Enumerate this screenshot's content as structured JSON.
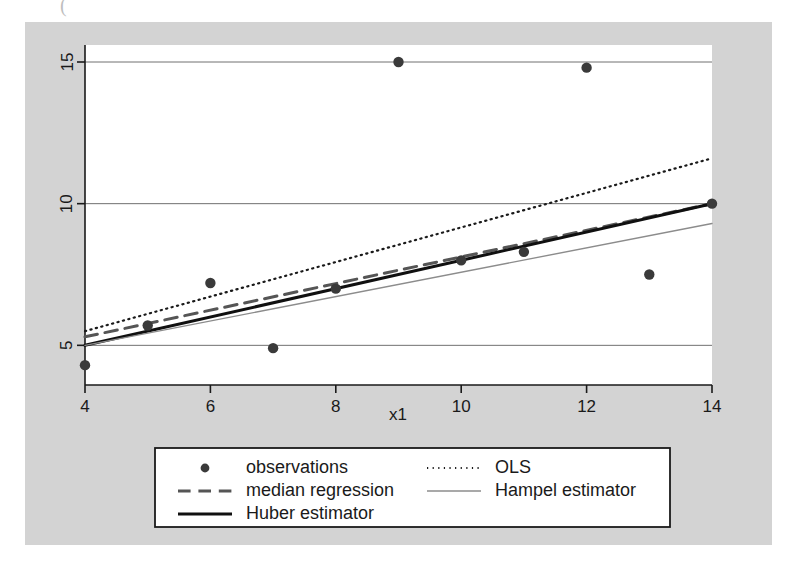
{
  "figure": {
    "canvas_color": "#d3d3d3",
    "plot_background": "#ffffff",
    "artifact_glyph": "("
  },
  "chart_data": {
    "type": "scatter",
    "title": "",
    "xlabel": "x1",
    "ylabel": "",
    "xlim": [
      4,
      14
    ],
    "ylim": [
      3.6,
      15.6
    ],
    "xticks": [
      4,
      6,
      8,
      10,
      12,
      14
    ],
    "xticklabels": [
      "4",
      "6",
      "8",
      "10",
      "12",
      "14"
    ],
    "yticks": [
      5,
      10,
      15
    ],
    "yticklabels": [
      "5",
      "10",
      "15"
    ],
    "grid": "horizontal",
    "legend_position": "below-plot",
    "points": {
      "name": "observations",
      "x": [
        4,
        5,
        6,
        7,
        8,
        9,
        10,
        11,
        12,
        13,
        14
      ],
      "y": [
        4.3,
        5.7,
        7.2,
        4.9,
        7.0,
        15.0,
        8.0,
        8.3,
        14.8,
        7.5,
        10.0
      ],
      "color": "#3a3a3a",
      "marker": "filled-circle"
    },
    "series": [
      {
        "name": "OLS",
        "style": "dotted",
        "color": "#1a1a1a",
        "width": 2.2,
        "x": [
          4,
          14
        ],
        "y": [
          5.5,
          11.6
        ]
      },
      {
        "name": "median regression",
        "style": "dashed",
        "color": "#555555",
        "width": 3.0,
        "x": [
          4,
          14
        ],
        "y": [
          5.3,
          10.0
        ]
      },
      {
        "name": "Huber estimator",
        "style": "solid",
        "color": "#101010",
        "width": 3.0,
        "x": [
          4,
          14
        ],
        "y": [
          5.0,
          10.0
        ]
      },
      {
        "name": "Hampel estimator",
        "style": "solid",
        "color": "#8c8c8c",
        "width": 1.4,
        "x": [
          4,
          14
        ],
        "y": [
          5.0,
          9.3
        ]
      }
    ]
  },
  "legend": {
    "entries": [
      {
        "label": "observations",
        "marker": "dot",
        "column": 1,
        "row": 1
      },
      {
        "label": "OLS",
        "marker": "dotted-line",
        "column": 2,
        "row": 1
      },
      {
        "label": "median regression",
        "marker": "dashed-line",
        "column": 1,
        "row": 2
      },
      {
        "label": "Hampel estimator",
        "marker": "thin-line",
        "column": 2,
        "row": 2
      },
      {
        "label": "Huber estimator",
        "marker": "thick-line",
        "column": 1,
        "row": 3
      }
    ]
  }
}
